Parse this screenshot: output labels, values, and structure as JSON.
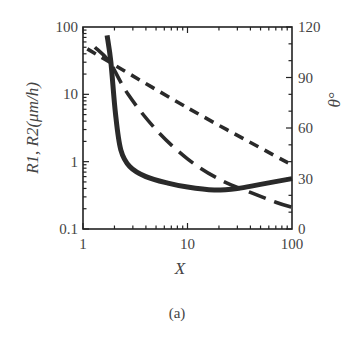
{
  "chart_data": {
    "type": "line",
    "title": "",
    "caption": "(a)",
    "xlabel": "X",
    "ylabel_left": "R1, R2(μm/h)",
    "ylabel_right": "θ°",
    "xscale": "log",
    "yscale_left": "log",
    "xlim": [
      1,
      100
    ],
    "ylim_left": [
      0.1,
      100
    ],
    "ylim_right": [
      0,
      120
    ],
    "x_ticks": [
      "1",
      "10",
      "100"
    ],
    "y_ticks_left": [
      "0.1",
      "1",
      "10",
      "100"
    ],
    "y_ticks_right": [
      "0",
      "30",
      "60",
      "90",
      "120"
    ],
    "grid": false,
    "legend": null,
    "series": [
      {
        "name": "R1",
        "axis": "left",
        "style": "solid-thick",
        "points": [
          [
            1.7,
            75
          ],
          [
            1.85,
            30
          ],
          [
            2.05,
            5
          ],
          [
            2.3,
            1.5
          ],
          [
            2.8,
            0.85
          ],
          [
            4,
            0.6
          ],
          [
            6.5,
            0.48
          ],
          [
            10,
            0.42
          ],
          [
            18,
            0.38
          ],
          [
            30,
            0.4
          ],
          [
            50,
            0.46
          ],
          [
            100,
            0.56
          ]
        ]
      },
      {
        "name": "R2",
        "axis": "left",
        "style": "long-dash",
        "points": [
          [
            1.3,
            50
          ],
          [
            1.8,
            30
          ],
          [
            2.7,
            10
          ],
          [
            5,
            3
          ],
          [
            10,
            1.1
          ],
          [
            20,
            0.55
          ],
          [
            40,
            0.35
          ],
          [
            70,
            0.25
          ],
          [
            100,
            0.21
          ]
        ]
      },
      {
        "name": "θ",
        "axis": "right",
        "style": "short-dash",
        "points": [
          [
            1.1,
            107
          ],
          [
            10,
            72
          ],
          [
            100,
            38
          ]
        ]
      }
    ]
  }
}
